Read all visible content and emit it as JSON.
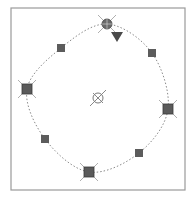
{
  "diagram": {
    "frame": {
      "x": 11,
      "y": 8,
      "width": 174,
      "height": 182,
      "stroke": "#9a9a9a"
    },
    "spline": {
      "stroke": "#8a8a8a",
      "dash": "1.5,2",
      "closed": true,
      "points": [
        [
          107,
          24
        ],
        [
          152,
          53
        ],
        [
          168,
          109
        ],
        [
          139,
          153
        ],
        [
          89,
          172
        ],
        [
          45,
          139
        ],
        [
          27,
          89
        ],
        [
          61,
          48
        ]
      ]
    },
    "nodes": [
      {
        "id": "top",
        "x": 107,
        "y": 24,
        "type": "crossed-circle",
        "fill": "#6a6a6a"
      },
      {
        "id": "left",
        "x": 27,
        "y": 89,
        "type": "crossed-square",
        "fill": "#5a5a5a"
      },
      {
        "id": "right",
        "x": 168,
        "y": 109,
        "type": "crossed-square",
        "fill": "#5a5a5a"
      },
      {
        "id": "bottom",
        "x": 89,
        "y": 172,
        "type": "crossed-square",
        "fill": "#5a5a5a"
      }
    ],
    "control_points": [
      {
        "id": "nw",
        "x": 61,
        "y": 48
      },
      {
        "id": "ne",
        "x": 152,
        "y": 53
      },
      {
        "id": "sw",
        "x": 45,
        "y": 139
      },
      {
        "id": "se",
        "x": 139,
        "y": 153
      }
    ],
    "control_point_fill": "#5c5c5c",
    "center": {
      "x": 98,
      "y": 98,
      "type": "crossed-circle",
      "stroke": "#7a7a7a"
    },
    "marker": {
      "x": 117,
      "y": 37,
      "type": "triangle-down",
      "fill": "#4a4a4a"
    }
  }
}
